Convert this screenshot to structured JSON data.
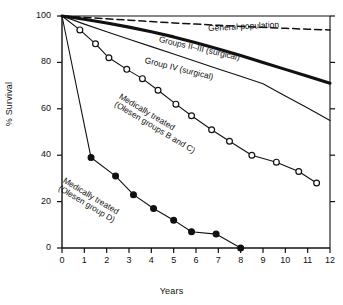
{
  "chart_data": {
    "type": "line",
    "title": "",
    "xlabel": "Years",
    "ylabel": "% Survival",
    "xlim": [
      0,
      12
    ],
    "ylim": [
      0,
      100
    ],
    "xticks": [
      "0",
      "1",
      "2",
      "3",
      "4",
      "5",
      "6",
      "7",
      "8",
      "9",
      "10",
      "11",
      "12"
    ],
    "yticks": [
      "0",
      "20",
      "40",
      "60",
      "80",
      "100"
    ],
    "grid": false,
    "legend_position": "inline-annotations",
    "series": [
      {
        "name": "General population",
        "style": "dashed",
        "marker": "none",
        "color": "#111111",
        "x": [
          0,
          1,
          2,
          3,
          4,
          5,
          6,
          7,
          8,
          9,
          10,
          11,
          12
        ],
        "y": [
          100,
          99.4,
          98.8,
          98.2,
          97.6,
          97.0,
          96.5,
          96.0,
          95.5,
          95.1,
          94.7,
          94.3,
          94.0
        ]
      },
      {
        "name": "Groups II–III (surgical)",
        "style": "solid-thick",
        "marker": "none",
        "color": "#111111",
        "x": [
          0,
          1,
          2,
          3,
          4,
          5,
          6,
          7,
          8,
          9,
          10,
          11,
          12
        ],
        "y": [
          100,
          98.6,
          97.0,
          95.2,
          93.2,
          91.0,
          88.5,
          85.8,
          83.0,
          80.0,
          77.0,
          74.0,
          71.0
        ]
      },
      {
        "name": "Group IV (surgical)",
        "style": "solid-thin",
        "marker": "none",
        "color": "#111111",
        "x": [
          0,
          1,
          2,
          3,
          4,
          5,
          6,
          7,
          8,
          9,
          10,
          11,
          12
        ],
        "y": [
          100,
          96.5,
          93.2,
          90.0,
          86.8,
          83.6,
          80.4,
          77.2,
          74.0,
          70.8,
          65.5,
          60.3,
          55.0
        ]
      },
      {
        "name": "Medically treated (Olesen groups B and C)",
        "style": "solid-thin",
        "marker": "open-circle",
        "color": "#111111",
        "x": [
          0,
          0.8,
          1.5,
          2.1,
          2.9,
          3.6,
          4.3,
          5.1,
          5.8,
          6.7,
          7.5,
          8.5,
          9.6,
          10.6,
          11.4
        ],
        "y": [
          100,
          94,
          88,
          82,
          77,
          73,
          68,
          62,
          57,
          51,
          46,
          40,
          37,
          33,
          28
        ]
      },
      {
        "name": "Medically treated (Olesen group D)",
        "style": "solid-thin",
        "marker": "filled-circle",
        "color": "#111111",
        "x": [
          0,
          1.3,
          2.4,
          3.2,
          4.1,
          5.0,
          5.8,
          6.9,
          8.0
        ],
        "y": [
          100,
          39,
          31,
          23,
          17,
          12,
          7,
          6,
          0
        ]
      }
    ],
    "annotations": [
      {
        "key": "general_population",
        "text": "General population"
      },
      {
        "key": "groups_ii_iii",
        "text": "Groups II–III (surgical)"
      },
      {
        "key": "group_iv",
        "text": "Group IV (surgical)"
      },
      {
        "key": "med_bc_line1",
        "text": "Medically treated"
      },
      {
        "key": "med_bc_line2",
        "text": "(Olesen groups B and C)"
      },
      {
        "key": "med_d_line1",
        "text": "Medically treated"
      },
      {
        "key": "med_d_line2",
        "text": "(Olesen group D)"
      }
    ]
  }
}
